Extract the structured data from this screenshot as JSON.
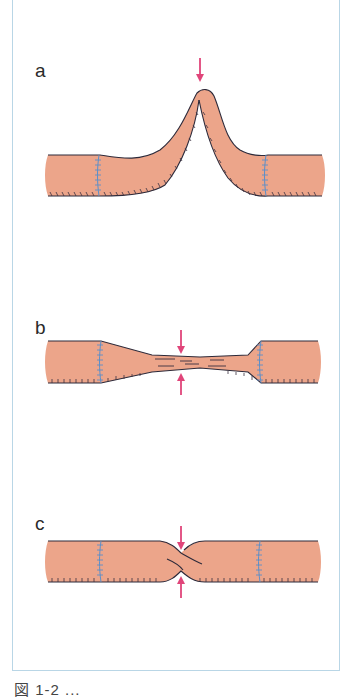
{
  "figure": {
    "panels": [
      {
        "label": "a",
        "description": "Kinked anastomosis — tube bent into a peak at center",
        "arrows": [
          "down"
        ]
      },
      {
        "label": "b",
        "description": "Stenosed anastomosis — tube narrowed at center",
        "arrows": [
          "down",
          "up"
        ]
      },
      {
        "label": "c",
        "description": "Twisted anastomosis — tube twisted at center",
        "arrows": [
          "down",
          "up"
        ]
      }
    ],
    "caption": "図 1-2 ..."
  },
  "colors": {
    "tube_fill": "#eca58a",
    "tube_outline": "#2d2a3a",
    "suture": "#5b8fc9",
    "arrow": "#e0457a",
    "frame_border": "#b9d6e6"
  }
}
